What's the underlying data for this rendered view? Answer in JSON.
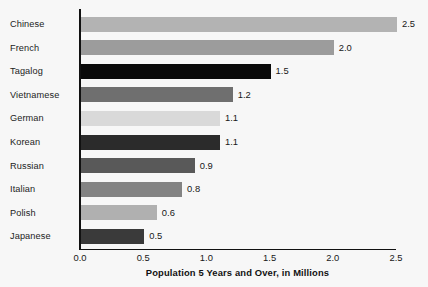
{
  "chart_data": {
    "type": "bar",
    "orientation": "horizontal",
    "title": "",
    "xlabel": "Population 5 Years and Over, in Millions",
    "ylabel": "",
    "categories": [
      "Chinese",
      "French",
      "Tagalog",
      "Vietnamese",
      "German",
      "Korean",
      "Russian",
      "Italian",
      "Polish",
      "Japanese"
    ],
    "values": [
      2.5,
      2.0,
      1.5,
      1.2,
      1.1,
      1.1,
      0.9,
      0.8,
      0.6,
      0.5
    ],
    "value_labels": [
      "2.5",
      "2.0",
      "1.5",
      "1.2",
      "1.1",
      "1.1",
      "0.9",
      "0.8",
      "0.6",
      "0.5"
    ],
    "bar_colors": [
      "#b3b3b3",
      "#9c9c9c",
      "#0a0a0a",
      "#6f6f6f",
      "#d9d9d9",
      "#2b2b2b",
      "#595959",
      "#838383",
      "#b0b0b0",
      "#3a3a3a"
    ],
    "xlim": [
      0.0,
      2.5
    ],
    "xticks": [
      0.0,
      0.5,
      1.0,
      1.5,
      2.0,
      2.5
    ],
    "xtick_labels": [
      "0.0",
      "0.5",
      "1.0",
      "1.5",
      "2.0",
      "2.5"
    ],
    "grid": false,
    "legend": false,
    "background_color": "#f7f7f7",
    "axis_color": "#111111"
  }
}
